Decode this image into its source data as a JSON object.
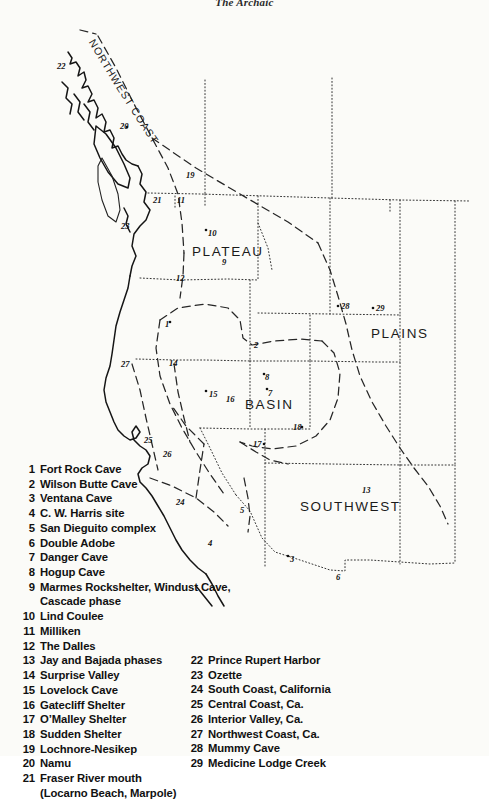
{
  "running_head": "The Archaic",
  "map": {
    "region_labels": [
      {
        "name": "northwest-coast",
        "text": "NORTHWEST COAST"
      },
      {
        "name": "plateau",
        "text": "PLATEAU"
      },
      {
        "name": "plains",
        "text": "PLAINS"
      },
      {
        "name": "basin",
        "text": "BASIN"
      },
      {
        "name": "southwest",
        "text": "SOUTHWEST"
      }
    ],
    "site_markers": [
      {
        "id": "22",
        "x": 62,
        "y": 58
      },
      {
        "id": "20",
        "x": 125,
        "y": 118
      },
      {
        "id": "19",
        "x": 190,
        "y": 167
      },
      {
        "id": "21",
        "x": 158,
        "y": 192
      },
      {
        "id": "11",
        "x": 180,
        "y": 192
      },
      {
        "id": "23",
        "x": 127,
        "y": 218
      },
      {
        "id": "10",
        "x": 211,
        "y": 225
      },
      {
        "id": "9",
        "x": 225,
        "y": 254
      },
      {
        "id": "12",
        "x": 180,
        "y": 270
      },
      {
        "id": "28",
        "x": 344,
        "y": 298
      },
      {
        "id": "29",
        "x": 379,
        "y": 300
      },
      {
        "id": "1",
        "x": 168,
        "y": 316
      },
      {
        "id": "2",
        "x": 257,
        "y": 337
      },
      {
        "id": "27",
        "x": 126,
        "y": 356
      },
      {
        "id": "14",
        "x": 173,
        "y": 355
      },
      {
        "id": "8",
        "x": 268,
        "y": 369
      },
      {
        "id": "15",
        "x": 212,
        "y": 386
      },
      {
        "id": "16",
        "x": 229,
        "y": 391
      },
      {
        "id": "7",
        "x": 271,
        "y": 385
      },
      {
        "id": "18",
        "x": 296,
        "y": 419
      },
      {
        "id": "25",
        "x": 147,
        "y": 432
      },
      {
        "id": "17",
        "x": 257,
        "y": 436
      },
      {
        "id": "26",
        "x": 167,
        "y": 446
      },
      {
        "id": "13",
        "x": 365,
        "y": 482
      },
      {
        "id": "24",
        "x": 180,
        "y": 494
      },
      {
        "id": "5",
        "x": 243,
        "y": 502
      },
      {
        "id": "4",
        "x": 211,
        "y": 535
      },
      {
        "id": "3",
        "x": 293,
        "y": 551
      },
      {
        "id": "6",
        "x": 339,
        "y": 569
      }
    ]
  },
  "legend": {
    "left_column": [
      {
        "num": "1",
        "text": "Fort Rock Cave"
      },
      {
        "num": "2",
        "text": "Wilson Butte Cave"
      },
      {
        "num": "3",
        "text": "Ventana Cave"
      },
      {
        "num": "4",
        "text": "C. W. Harris site"
      },
      {
        "num": "5",
        "text": "San Dieguito complex"
      },
      {
        "num": "6",
        "text": "Double Adobe"
      },
      {
        "num": "7",
        "text": "Danger Cave"
      },
      {
        "num": "8",
        "text": "Hogup Cave"
      },
      {
        "num": "9",
        "text": "Marmes Rockshelter, Windust Cave,"
      },
      {
        "num": "",
        "text": "Cascade phase",
        "continuation": true
      },
      {
        "num": "10",
        "text": "Lind Coulee"
      },
      {
        "num": "11",
        "text": "Milliken"
      },
      {
        "num": "12",
        "text": "The Dalles"
      },
      {
        "num": "13",
        "text": "Jay and Bajada phases"
      },
      {
        "num": "14",
        "text": "Surprise Valley"
      },
      {
        "num": "15",
        "text": "Lovelock Cave"
      },
      {
        "num": "16",
        "text": "Gatecliff Shelter"
      },
      {
        "num": "17",
        "text": "O’Malley Shelter"
      },
      {
        "num": "18",
        "text": "Sudden Shelter"
      },
      {
        "num": "19",
        "text": "Lochnore-Nesikep"
      },
      {
        "num": "20",
        "text": "Namu"
      },
      {
        "num": "21",
        "text": "Fraser River mouth"
      },
      {
        "num": "",
        "text": "(Locarno Beach, Marpole)",
        "continuation": true
      }
    ],
    "right_column": [
      {
        "num": "22",
        "text": "Prince Rupert Harbor"
      },
      {
        "num": "23",
        "text": "Ozette"
      },
      {
        "num": "24",
        "text": "South Coast, California"
      },
      {
        "num": "25",
        "text": "Central Coast, Ca."
      },
      {
        "num": "26",
        "text": "Interior Valley, Ca."
      },
      {
        "num": "27",
        "text": "Northwest Coast, Ca."
      },
      {
        "num": "28",
        "text": "Mummy Cave"
      },
      {
        "num": "29",
        "text": "Medicine Lodge Creek"
      }
    ]
  },
  "colors": {
    "paper": "#fbfbf8",
    "ink": "#111111",
    "line": "#222222"
  }
}
